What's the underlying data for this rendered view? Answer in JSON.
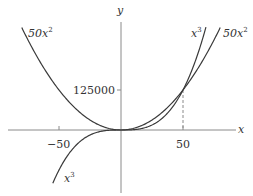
{
  "chart_data": {
    "type": "line",
    "title": "",
    "xlabel": "x",
    "ylabel": "y",
    "xlim": [
      -80,
      100
    ],
    "ylim": [
      -170000,
      370000
    ],
    "grid": false,
    "x_ticks": [
      {
        "value": -50,
        "label": "−50"
      },
      {
        "value": 50,
        "label": "50"
      }
    ],
    "y_ticks": [
      {
        "value": 125000,
        "label": "125000"
      }
    ],
    "series": [
      {
        "name": "50x^2",
        "label": "50x²",
        "formula": "50*x^2",
        "x_range": [
          -80,
          80
        ]
      },
      {
        "name": "x^3",
        "label": "x³",
        "formula": "x^3",
        "x_range": [
          -55,
          68.5
        ]
      }
    ],
    "annotations": [
      {
        "type": "dashed-vline",
        "x": 50,
        "from_y": 0,
        "to_y": 125000,
        "note": "intersection of x^3 and 50x^2"
      }
    ],
    "curve_labels": [
      {
        "text": "50x²",
        "position": "upper-left"
      },
      {
        "text": "x³",
        "position": "upper-right"
      },
      {
        "text": "50x²",
        "position": "upper-right"
      },
      {
        "text": "x³",
        "position": "lower-left"
      }
    ]
  },
  "labels": {
    "x_axis": "x",
    "y_axis": "y",
    "tick_neg50": "−50",
    "tick_50": "50",
    "tick_125000": "125000",
    "curve_left_coef": "50x",
    "curve_left_exp": "2",
    "curve_right_cubic_base": "x",
    "curve_right_cubic_exp": "3",
    "curve_right_coef": "50x",
    "curve_right_exp": "2",
    "curve_bottom_base": "x",
    "curve_bottom_exp": "3"
  },
  "colors": {
    "curve": "#3a3a3a",
    "axis": "#8a8a8a",
    "text": "#333333"
  }
}
